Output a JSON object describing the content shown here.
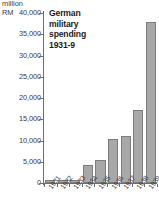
{
  "chart": {
    "title_lines": [
      "German",
      "military",
      "spending",
      "1931-9"
    ],
    "unit_line1": "million",
    "unit_line2": "RM",
    "bar_color": "#a8a8a8",
    "bar_border_color": "#7d7d7d",
    "axis_color": "#6d6d6d",
    "text_color": "#3a3a3a"
  },
  "chart_data": {
    "type": "bar",
    "title": "German military spending 1931-9",
    "xlabel": "",
    "ylabel": "million RM",
    "categories": [
      "1931",
      "1932",
      "1933",
      "1934",
      "1935",
      "1936",
      "1937",
      "1938",
      "1939"
    ],
    "values": [
      610,
      720,
      750,
      4200,
      5500,
      10300,
      11000,
      17200,
      38000
    ],
    "ylim": [
      0,
      40000
    ],
    "yticks": [
      0,
      5000,
      10000,
      15000,
      20000,
      25000,
      30000,
      35000,
      40000
    ],
    "ytick_labels": [
      "0",
      "5,000",
      "10,000",
      "15,000",
      "20,000",
      "25,000",
      "30,000",
      "35,000",
      "40,000"
    ],
    "grid": false,
    "legend": null
  }
}
